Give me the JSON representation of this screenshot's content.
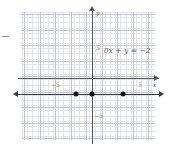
{
  "chart_data": {
    "type": "line",
    "title": "",
    "annotation": "0x + y = −2",
    "equation_text": "0x + y = −2",
    "xlabel": "x",
    "ylabel": "y",
    "xlim": [
      -8.5,
      8.5
    ],
    "ylim": [
      -7.5,
      7.5
    ],
    "grid": true,
    "grid_minor_step": 0.333,
    "grid_major_step": 1,
    "legend": "none",
    "x_tick_labels": [
      "−5",
      "5"
    ],
    "x_tick_values": [
      -5,
      5
    ],
    "y_tick_labels": [
      "5",
      "−5"
    ],
    "y_tick_values": [
      5,
      -5
    ],
    "series": [
      {
        "name": "y = −2",
        "type": "line",
        "equation": "y = -2",
        "x": [
          -8.5,
          8.5
        ],
        "values": [
          -2,
          -2
        ],
        "arrows_both_ends": true,
        "color": "#3a3a3a"
      }
    ],
    "points": [
      {
        "x": -2,
        "y": -2,
        "label": "(−2, −2)"
      },
      {
        "x": 0,
        "y": -2,
        "label": "(0, −2)"
      },
      {
        "x": 4,
        "y": -2,
        "label": "(4, −2)"
      }
    ],
    "axis_color": "#555555",
    "grid_color": "#e3e3ea",
    "grid_major_color": "#c3c3cc",
    "point_color": "#111111"
  },
  "axes": {
    "x_axis_name": "x",
    "y_axis_name": "y",
    "x_negative_tick": "−5",
    "x_positive_tick": "5",
    "y_positive_tick": "5",
    "y_negative_tick": "−5"
  }
}
